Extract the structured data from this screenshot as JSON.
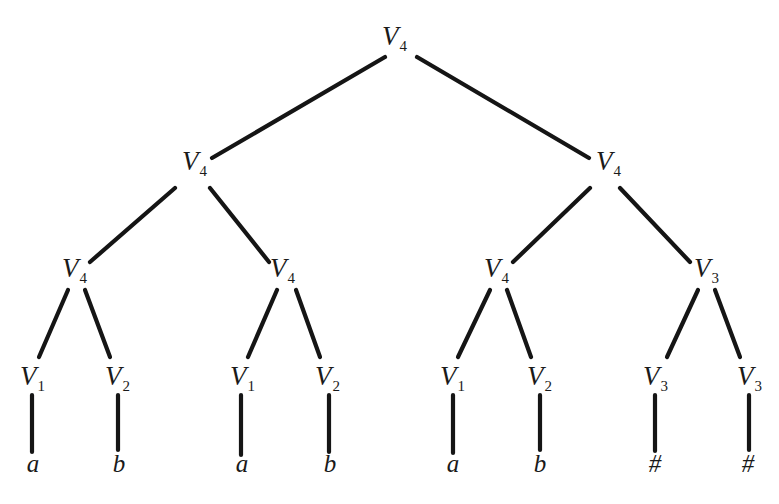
{
  "diagram": {
    "type": "parse-tree",
    "root": "V4",
    "nodes": [
      {
        "id": "n0",
        "sym": "V",
        "sub": "4",
        "x": 392,
        "y": 45
      },
      {
        "id": "n1",
        "sym": "V",
        "sub": "4",
        "x": 192,
        "y": 170
      },
      {
        "id": "n2",
        "sym": "V",
        "sub": "4",
        "x": 606,
        "y": 170
      },
      {
        "id": "n3",
        "sym": "V",
        "sub": "4",
        "x": 72,
        "y": 277
      },
      {
        "id": "n4",
        "sym": "V",
        "sub": "4",
        "x": 280,
        "y": 277
      },
      {
        "id": "n5",
        "sym": "V",
        "sub": "4",
        "x": 494,
        "y": 277
      },
      {
        "id": "n6",
        "sym": "V",
        "sub": "3",
        "x": 704,
        "y": 277
      },
      {
        "id": "n7",
        "sym": "V",
        "sub": "1",
        "x": 30,
        "y": 385
      },
      {
        "id": "n8",
        "sym": "V",
        "sub": "2",
        "x": 115,
        "y": 385
      },
      {
        "id": "n9",
        "sym": "V",
        "sub": "1",
        "x": 240,
        "y": 385
      },
      {
        "id": "n10",
        "sym": "V",
        "sub": "2",
        "x": 325,
        "y": 385
      },
      {
        "id": "n11",
        "sym": "V",
        "sub": "1",
        "x": 450,
        "y": 385
      },
      {
        "id": "n12",
        "sym": "V",
        "sub": "2",
        "x": 537,
        "y": 385
      },
      {
        "id": "n13",
        "sym": "V",
        "sub": "3",
        "x": 653,
        "y": 385
      },
      {
        "id": "n14",
        "sym": "V",
        "sub": "3",
        "x": 747,
        "y": 385
      }
    ],
    "leaves": [
      {
        "id": "l0",
        "label": "a",
        "x": 33,
        "y": 472
      },
      {
        "id": "l1",
        "label": "b",
        "x": 119,
        "y": 472
      },
      {
        "id": "l2",
        "label": "a",
        "x": 242,
        "y": 472
      },
      {
        "id": "l3",
        "label": "b",
        "x": 330,
        "y": 472
      },
      {
        "id": "l4",
        "label": "a",
        "x": 453,
        "y": 472
      },
      {
        "id": "l5",
        "label": "b",
        "x": 540,
        "y": 472
      },
      {
        "id": "l6",
        "label": "#",
        "x": 655,
        "y": 472
      },
      {
        "id": "l7",
        "label": "#",
        "x": 748,
        "y": 472
      }
    ],
    "edges": [
      {
        "from": "n0",
        "to": "n1",
        "x1": 385,
        "y1": 57,
        "x2": 212,
        "y2": 158
      },
      {
        "from": "n0",
        "to": "n2",
        "x1": 417,
        "y1": 57,
        "x2": 589,
        "y2": 158
      },
      {
        "from": "n1",
        "to": "n3",
        "x1": 175,
        "y1": 188,
        "x2": 90,
        "y2": 262
      },
      {
        "from": "n1",
        "to": "n4",
        "x1": 210,
        "y1": 188,
        "x2": 269,
        "y2": 262
      },
      {
        "from": "n2",
        "to": "n5",
        "x1": 590,
        "y1": 188,
        "x2": 513,
        "y2": 262
      },
      {
        "from": "n2",
        "to": "n6",
        "x1": 620,
        "y1": 188,
        "x2": 690,
        "y2": 262
      },
      {
        "from": "n3",
        "to": "n7",
        "x1": 68,
        "y1": 290,
        "x2": 39,
        "y2": 357
      },
      {
        "from": "n3",
        "to": "n8",
        "x1": 85,
        "y1": 290,
        "x2": 110,
        "y2": 357
      },
      {
        "from": "n4",
        "to": "n9",
        "x1": 277,
        "y1": 290,
        "x2": 248,
        "y2": 357
      },
      {
        "from": "n4",
        "to": "n10",
        "x1": 296,
        "y1": 290,
        "x2": 320,
        "y2": 357
      },
      {
        "from": "n5",
        "to": "n11",
        "x1": 490,
        "y1": 290,
        "x2": 458,
        "y2": 357
      },
      {
        "from": "n5",
        "to": "n12",
        "x1": 507,
        "y1": 290,
        "x2": 531,
        "y2": 357
      },
      {
        "from": "n6",
        "to": "n13",
        "x1": 698,
        "y1": 290,
        "x2": 667,
        "y2": 357
      },
      {
        "from": "n6",
        "to": "n14",
        "x1": 715,
        "y1": 290,
        "x2": 740,
        "y2": 357
      },
      {
        "from": "n7",
        "to": "l0",
        "x1": 32,
        "y1": 395,
        "x2": 32,
        "y2": 452
      },
      {
        "from": "n8",
        "to": "l1",
        "x1": 118,
        "y1": 395,
        "x2": 118,
        "y2": 450
      },
      {
        "from": "n9",
        "to": "l2",
        "x1": 241,
        "y1": 395,
        "x2": 241,
        "y2": 455
      },
      {
        "from": "n10",
        "to": "l3",
        "x1": 329,
        "y1": 395,
        "x2": 329,
        "y2": 452
      },
      {
        "from": "n11",
        "to": "l4",
        "x1": 453,
        "y1": 395,
        "x2": 453,
        "y2": 453
      },
      {
        "from": "n12",
        "to": "l5",
        "x1": 540,
        "y1": 395,
        "x2": 540,
        "y2": 450
      },
      {
        "from": "n13",
        "to": "l6",
        "x1": 655,
        "y1": 395,
        "x2": 655,
        "y2": 451
      },
      {
        "from": "n14",
        "to": "l7",
        "x1": 749,
        "y1": 395,
        "x2": 749,
        "y2": 450
      }
    ]
  }
}
